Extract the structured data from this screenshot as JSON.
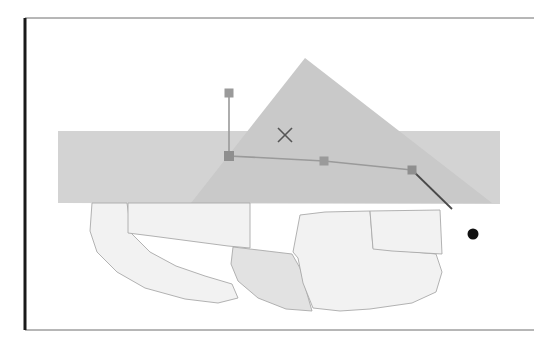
{
  "figure": {
    "title": "",
    "background_color": "#ffffff",
    "width": 554,
    "height": 351,
    "scan_quality": "low-contrast photocopy",
    "frame": {
      "name": "drawing-border",
      "left": 25,
      "top": 18,
      "right": 534,
      "bottom": 330,
      "left_edge_color": "#1a1a1a",
      "left_edge_width": 3,
      "other_edge_color": "#6e6e6e",
      "other_edge_width": 1
    },
    "colors": {
      "band_gray": "#d3d3d3",
      "triangle_gray": "#c9c9c9",
      "polygon_light": "#f2f2f2",
      "polygon_mid": "#e2e2e2",
      "polygon_outline": "#a9a9a9",
      "marker_gray": "#9a9a9a",
      "polyline_gray": "#9a9a9a",
      "dark_line": "#4a4a4a",
      "x_marker": "#555555",
      "dot_black": "#111111"
    },
    "shapes": [
      {
        "name": "horizontal-band",
        "type": "polygon",
        "fill": "#d3d3d3",
        "points": "58,131 500,131 500,204 58,203"
      },
      {
        "name": "large-triangle",
        "type": "polygon",
        "fill": "#c9c9c9",
        "points": "305,58 492,203 191,203"
      },
      {
        "name": "polygon-left-lobe",
        "type": "polygon",
        "fill": "#f2f2f2",
        "stroke": "#a9a9a9",
        "points": "92,203 90,231 97,252 117,272 145,288 185,299 218,303 238,298 232,284 205,276 176,266 150,252 131,233 128,210 127,203"
      },
      {
        "name": "polygon-center-upper",
        "type": "polygon",
        "fill": "#f2f2f2",
        "stroke": "#a9a9a9",
        "points": "128,203 128,233 152,236 190,241 228,246 250,248 250,212 250,203"
      },
      {
        "name": "polygon-center-lower",
        "type": "polygon",
        "fill": "#e2e2e2",
        "stroke": "#a9a9a9",
        "points": "233,247 250,249 292,254 300,268 306,290 312,311 286,309 258,298 238,281 231,264"
      },
      {
        "name": "polygon-right-big",
        "type": "polygon",
        "fill": "#f2f2f2",
        "stroke": "#a9a9a9",
        "points": "300,215 325,212 370,211 373,248 392,250 436,254 442,272 436,292 412,303 370,309 340,311 313,308 303,283 298,258 293,252"
      },
      {
        "name": "polygon-right-upper-notch",
        "type": "polygon",
        "fill": "#f2f2f2",
        "stroke": "#a9a9a9",
        "points": "370,211 440,210 442,254 392,251 373,249"
      }
    ],
    "annotations": {
      "polyline": {
        "name": "measurement-polyline",
        "stroke": "#9a9a9a",
        "stroke_width": 1.6,
        "points": "229,93 229,156 324,161 412,170"
      },
      "leader_line": {
        "name": "leader-line",
        "stroke": "#4a4a4a",
        "stroke_width": 1.8,
        "x1": 412,
        "y1": 170,
        "x2": 452,
        "y2": 209
      },
      "vertex_markers": [
        {
          "name": "vertex-marker-1",
          "cx": 229,
          "cy": 93,
          "size": 9,
          "fill": "#9a9a9a"
        },
        {
          "name": "vertex-marker-2",
          "cx": 229,
          "cy": 156,
          "size": 10,
          "fill": "#8f8f8f"
        },
        {
          "name": "vertex-marker-3",
          "cx": 324,
          "cy": 161,
          "size": 9,
          "fill": "#9a9a9a"
        },
        {
          "name": "vertex-marker-4",
          "cx": 412,
          "cy": 170,
          "size": 9,
          "fill": "#8f8f8f"
        }
      ],
      "x_marker": {
        "name": "x-cross-marker",
        "cx": 285,
        "cy": 135,
        "half": 7,
        "stroke": "#555555",
        "stroke_width": 1.6
      },
      "dot_marker": {
        "name": "point-of-interest-dot",
        "cx": 473,
        "cy": 234,
        "r": 5.5,
        "fill": "#111111"
      }
    }
  },
  "labels": {
    "x_marker_label": "",
    "dot_label": "",
    "figure_caption": ""
  }
}
